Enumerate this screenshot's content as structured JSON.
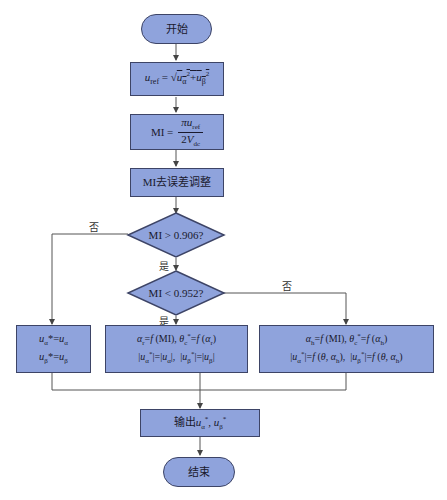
{
  "flowchart": {
    "start": "开始",
    "step_uref": "u_ref = √(u_α² + u_β²)",
    "step_uref_lhs": "u",
    "step_uref_lhs_sub": "ref",
    "step_mi_lhs": "MI =",
    "step_mi_num": "πu",
    "step_mi_num_sub": "ref",
    "step_mi_den": "2V",
    "step_mi_den_sub": "dc",
    "step_mi_adjust": "MI去误差调整",
    "decision1": "MI > 0.906?",
    "decision1_no": "否",
    "decision1_yes": "是",
    "decision2": "MI < 0.952?",
    "decision2_no": "否",
    "decision2_yes": "是",
    "box_left_line1": "u_α* = u_α",
    "box_left_line2": "u_β* = u_β",
    "box_mid_line1": "α_r = f(MI), θ_c* = f(α_r)",
    "box_mid_line2": "|u_α*| = |u_α|,  |u_β*| = |u_β|",
    "box_right_line1": "α_h = f(MI), θ_c* = f(α_h)",
    "box_right_line2": "|u_α*| = f(θ, α_h),  |u_β*| = f(θ, α_h)",
    "output": "输出u_α*, u_β*",
    "end": "结束"
  },
  "colors": {
    "fill": "#8fa3dc",
    "border": "#3d4466",
    "line": "#444444"
  }
}
